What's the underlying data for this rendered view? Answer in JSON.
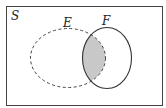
{
  "diagram": {
    "type": "venn",
    "universe_label": "S",
    "sets": [
      {
        "label": "E",
        "outline": "dashed"
      },
      {
        "label": "F",
        "outline": "solid"
      }
    ],
    "shaded_region": "E ∩ F",
    "colors": {
      "background": "#ffffff",
      "stroke": "#333333",
      "shade": "#c8c8c8"
    }
  }
}
